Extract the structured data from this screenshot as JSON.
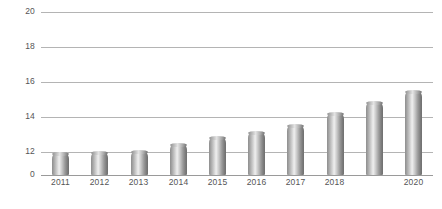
{
  "chart_data": {
    "type": "bar",
    "title": "",
    "subtitle": "",
    "xlabel": "",
    "ylabel": "",
    "categories": [
      "2011",
      "2012",
      "2013",
      "2014",
      "2015",
      "2016",
      "2017",
      "2018",
      "2019",
      "2020"
    ],
    "values": [
      11.0,
      11.3,
      12.0,
      12.4,
      12.8,
      13.1,
      13.5,
      14.2,
      14.8,
      15.4
    ],
    "series": [
      {
        "name": "",
        "values": [
          11.0,
          11.3,
          12.0,
          12.4,
          12.8,
          13.1,
          13.5,
          14.2,
          14.8,
          15.4
        ]
      }
    ],
    "ylim": [
      0,
      20
    ],
    "y_ticks": [
      0,
      12,
      14,
      16,
      18,
      20
    ],
    "y_tick_labels": [
      "0",
      "12",
      "14",
      "16",
      "18",
      "20"
    ],
    "x_tick_labels": [
      "2011",
      "2012",
      "2013",
      "2014",
      "2015",
      "2016",
      "2017",
      "2018",
      "",
      "2020"
    ],
    "axis_break": true,
    "axis_break_note": "y-axis compressed between 0 and 12",
    "grid": true,
    "grid_axis": "y",
    "legend": false,
    "legend_position": "none",
    "bar_style": "3d-cylinder",
    "colors": {
      "bar_light": "#efefef",
      "bar_mid": "#a8a8a8",
      "bar_dark": "#6f6f6f",
      "gridline": "#b4b4b4",
      "baseline": "#9a9a9a",
      "tick_label": "#555555",
      "background": "#ffffff"
    }
  }
}
